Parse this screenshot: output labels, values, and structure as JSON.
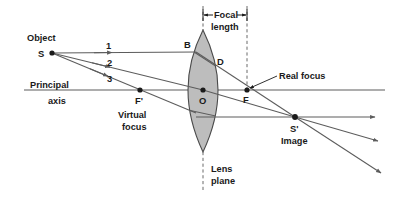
{
  "diagram": {
    "background_color": "#ffffff",
    "ink_color": "#5c5c5c",
    "text_color": "#1a1a1a",
    "lens_fill_color": "#bdbdbd",
    "lens_stroke_color": "#4a4a4a"
  },
  "labels": {
    "object": "Object",
    "object_point": "S",
    "principal": "Principal",
    "axis": "axis",
    "ray_1": "1",
    "ray_2": "2",
    "ray_3": "3",
    "point_b": "B",
    "point_d": "D",
    "point_o": "O",
    "point_f": "F",
    "point_f_prime": "F'",
    "virtual": "Virtual",
    "virtual_focus": "focus",
    "real_focus": "Real focus",
    "focal": "Focal",
    "focal_length": "length",
    "lens": "Lens",
    "lens_plane": "plane",
    "image_point": "S'",
    "image": "Image"
  },
  "geometry": {
    "principal_axis_y": 90,
    "object_point": {
      "x": 52,
      "y": 53
    },
    "lens_center": {
      "x": 203,
      "y": 90
    },
    "lens_top": {
      "x": 203,
      "y": 30
    },
    "lens_bottom": {
      "x": 203,
      "y": 152
    },
    "lens_half_width": 15,
    "real_focus": {
      "x": 247,
      "y": 90
    },
    "virtual_focus": {
      "x": 140,
      "y": 90
    },
    "point_b": {
      "x": 196,
      "y": 52
    },
    "point_d": {
      "x": 215,
      "y": 66
    },
    "image_point": {
      "x": 295,
      "y": 117
    },
    "focal_length_px": 44
  }
}
